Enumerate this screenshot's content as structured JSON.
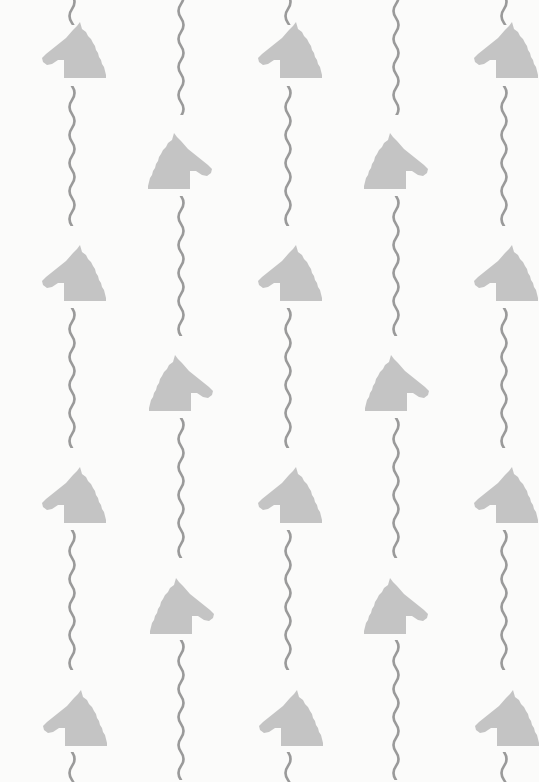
{
  "pattern": {
    "description": "Wallpaper pattern of horse-head silhouettes alternating with vertical wavy lines",
    "colors": {
      "background": "#fbfbfa",
      "horse": "#c4c4c4",
      "wave": "#9a9a9a"
    },
    "horses_left_facing": [
      {
        "x": 42,
        "y": 20
      },
      {
        "x": 258,
        "y": 20
      },
      {
        "x": 474,
        "y": 20
      },
      {
        "x": 42,
        "y": 243
      },
      {
        "x": 258,
        "y": 243
      },
      {
        "x": 474,
        "y": 243
      },
      {
        "x": 42,
        "y": 465
      },
      {
        "x": 258,
        "y": 465
      },
      {
        "x": 474,
        "y": 465
      },
      {
        "x": 43,
        "y": 688
      },
      {
        "x": 259,
        "y": 688
      },
      {
        "x": 475,
        "y": 688
      }
    ],
    "horses_right_facing": [
      {
        "x": 148,
        "y": 131
      },
      {
        "x": 364,
        "y": 131
      },
      {
        "x": 149,
        "y": 353
      },
      {
        "x": 365,
        "y": 353
      },
      {
        "x": 150,
        "y": 576
      },
      {
        "x": 364,
        "y": 576
      }
    ],
    "waves": [
      {
        "x": 66,
        "y": -5,
        "h": 30
      },
      {
        "x": 66,
        "y": 86,
        "h": 140
      },
      {
        "x": 66,
        "y": 308,
        "h": 140
      },
      {
        "x": 66,
        "y": 530,
        "h": 140
      },
      {
        "x": 66,
        "y": 752,
        "h": 30
      },
      {
        "x": 175,
        "y": -10,
        "h": 125
      },
      {
        "x": 175,
        "y": 196,
        "h": 140
      },
      {
        "x": 175,
        "y": 418,
        "h": 140
      },
      {
        "x": 175,
        "y": 640,
        "h": 140
      },
      {
        "x": 282,
        "y": -5,
        "h": 30
      },
      {
        "x": 282,
        "y": 86,
        "h": 140
      },
      {
        "x": 282,
        "y": 308,
        "h": 140
      },
      {
        "x": 282,
        "y": 530,
        "h": 140
      },
      {
        "x": 282,
        "y": 752,
        "h": 30
      },
      {
        "x": 390,
        "y": -10,
        "h": 125
      },
      {
        "x": 390,
        "y": 196,
        "h": 140
      },
      {
        "x": 390,
        "y": 418,
        "h": 140
      },
      {
        "x": 390,
        "y": 640,
        "h": 140
      },
      {
        "x": 498,
        "y": -5,
        "h": 30
      },
      {
        "x": 498,
        "y": 86,
        "h": 140
      },
      {
        "x": 498,
        "y": 308,
        "h": 140
      },
      {
        "x": 498,
        "y": 530,
        "h": 140
      },
      {
        "x": 498,
        "y": 752,
        "h": 30
      }
    ]
  }
}
